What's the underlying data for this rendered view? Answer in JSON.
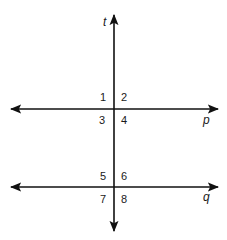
{
  "diagram": {
    "type": "parallel-lines-cut-by-transversal",
    "colors": {
      "line": "#111111",
      "text": "#1a1a1a",
      "background": "#ffffff"
    },
    "lines": {
      "transversal": {
        "label": "t"
      },
      "upper": {
        "label": "p"
      },
      "lower": {
        "label": "q"
      }
    },
    "angles": {
      "a1": "1",
      "a2": "2",
      "a3": "3",
      "a4": "4",
      "a5": "5",
      "a6": "6",
      "a7": "7",
      "a8": "8"
    }
  }
}
